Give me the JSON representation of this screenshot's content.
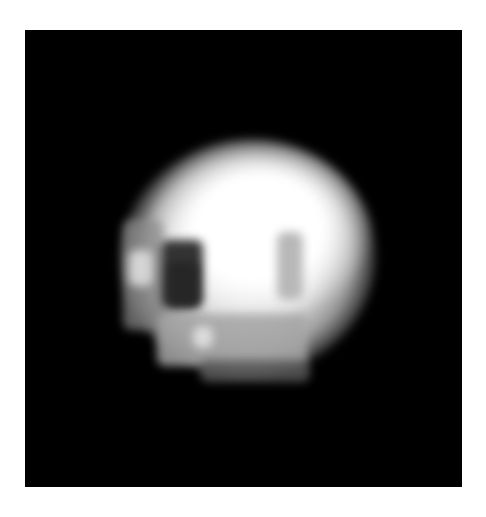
{
  "image": {
    "subject": "planetary-disk",
    "background_color": "#000000",
    "page_color": "#ffffff",
    "features": [
      {
        "name": "bright-disk",
        "color": "#ffffff"
      },
      {
        "name": "dark-spot",
        "color": "#2a2a2a"
      },
      {
        "name": "gray-stripe",
        "color": "#b8b8b8"
      },
      {
        "name": "limb-shading",
        "color": "#3a3a3a"
      }
    ]
  }
}
